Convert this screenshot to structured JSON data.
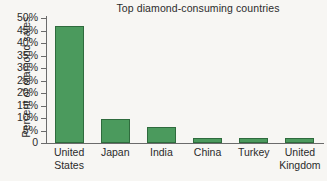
{
  "chart_data": {
    "type": "bar",
    "title": "Top diamond-consuming countries",
    "xlabel": "",
    "ylabel": "Percent of diamond sales",
    "categories": [
      "United States",
      "Japan",
      "India",
      "China",
      "Turkey",
      "United Kingdom"
    ],
    "values": [
      47,
      9.6,
      6.6,
      2.1,
      2.1,
      2.0
    ],
    "ylim": [
      0,
      50
    ],
    "yticks": [
      0,
      5,
      10,
      15,
      20,
      25,
      30,
      35,
      40,
      45,
      50
    ],
    "ytick_labels": [
      "0",
      "5%",
      "10%",
      "15%",
      "20%",
      "25%",
      "30%",
      "35%",
      "40%",
      "45%",
      "50%"
    ],
    "grid": false,
    "legend": false,
    "bar_color": "#4b9a5d",
    "bar_edge_color": "#2f6b3d",
    "axis_color": "#6b6b6b",
    "background_color": "#f7f6f3",
    "text_color": "#2b2b2b"
  }
}
